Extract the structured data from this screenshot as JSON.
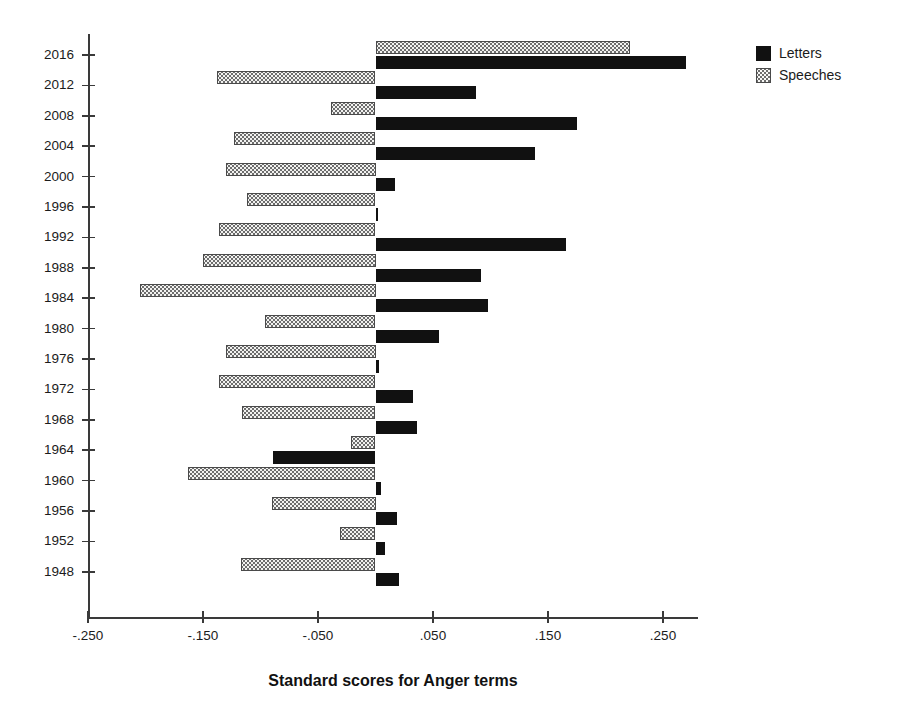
{
  "chart_data": {
    "type": "bar",
    "orientation": "horizontal",
    "title": "",
    "xlabel": "Standard scores for Anger terms",
    "ylabel": "",
    "xlim": [
      -0.25,
      0.3
    ],
    "xticks": [
      "-.250",
      "-.150",
      "-.050",
      ".050",
      ".150",
      ".250"
    ],
    "xtick_values": [
      -0.25,
      -0.15,
      -0.05,
      0.05,
      0.15,
      0.25
    ],
    "grid": false,
    "legend_position": "top-right",
    "categories": [
      "2016",
      "2012",
      "2008",
      "2004",
      "2000",
      "1996",
      "1992",
      "1988",
      "1984",
      "1980",
      "1976",
      "1972",
      "1968",
      "1964",
      "1960",
      "1956",
      "1952",
      "1948"
    ],
    "series": [
      {
        "name": "Letters",
        "color": "#111111",
        "pattern": "solid",
        "values": [
          0.27,
          0.087,
          0.175,
          0.139,
          0.017,
          0.002,
          0.166,
          0.092,
          0.098,
          0.055,
          0.003,
          0.033,
          0.036,
          -0.089,
          0.005,
          0.019,
          0.008,
          0.02
        ]
      },
      {
        "name": "Speeches",
        "color": "#f2f2f0",
        "pattern": "dotted",
        "values": [
          0.221,
          -0.138,
          -0.039,
          -0.123,
          -0.13,
          -0.112,
          -0.136,
          -0.15,
          -0.205,
          -0.096,
          -0.13,
          -0.136,
          -0.116,
          -0.021,
          -0.163,
          -0.09,
          -0.031,
          -0.117
        ]
      }
    ]
  },
  "legend": {
    "items": [
      {
        "label": "Letters",
        "swatch": "solid-black-swatch"
      },
      {
        "label": "Speeches",
        "swatch": "dotted-swatch"
      }
    ]
  },
  "axis": {
    "x_title": "Standard scores for Anger terms"
  }
}
